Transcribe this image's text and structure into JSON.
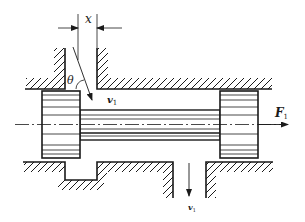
{
  "diagram": {
    "type": "mechanical-schematic",
    "labels": {
      "opening": "x",
      "jet_angle": "θ",
      "inlet_velocity": "v",
      "inlet_velocity_sub": "1",
      "outlet_velocity": "v",
      "outlet_velocity_sub": "1",
      "force": "F",
      "force_sub": "1"
    },
    "components": [
      {
        "id": "valve-body-upper",
        "desc": "hatched valve housing, upper side with inlet port"
      },
      {
        "id": "valve-body-lower",
        "desc": "hatched valve housing, lower side with annular groove and outlet port"
      },
      {
        "id": "spool-land-left",
        "desc": "left spool land"
      },
      {
        "id": "spool-land-right",
        "desc": "right spool land"
      },
      {
        "id": "spool-rod",
        "desc": "spool stem connecting lands"
      },
      {
        "id": "centerline",
        "desc": "dash-dot axis line"
      }
    ],
    "colors": {
      "line": "#1a1a1a",
      "background": "#ffffff"
    }
  }
}
